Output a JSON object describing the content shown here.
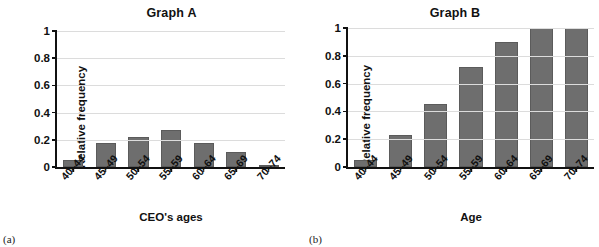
{
  "figure": {
    "panels": [
      {
        "caption": "(a)",
        "title": "Graph A",
        "ylabel": "Relative frequency",
        "xlabel": "CEO's ages",
        "bar_color": "#6e6e6e",
        "chart_data": {
          "type": "bar",
          "title": "Graph A",
          "xlabel": "CEO's ages",
          "ylabel": "Relative frequency",
          "categories": [
            "40–44",
            "45–49",
            "50–54",
            "55–59",
            "60–64",
            "65–69",
            "70–74"
          ],
          "values": [
            0.05,
            0.18,
            0.22,
            0.27,
            0.18,
            0.11,
            0.01
          ],
          "ylim": [
            0,
            1
          ],
          "yticks": [
            "0",
            "0.2",
            "0.4",
            "0.6",
            "0.8",
            "1"
          ],
          "ytick_values": [
            0,
            0.2,
            0.4,
            0.6,
            0.8,
            1
          ],
          "grid": true,
          "legend": "none"
        }
      },
      {
        "caption": "(b)",
        "title": "Graph B",
        "ylabel": "Relative frequency",
        "xlabel": "Age",
        "bar_color": "#6e6e6e",
        "chart_data": {
          "type": "bar",
          "title": "Graph B",
          "xlabel": "Age",
          "ylabel": "Relative frequency",
          "categories": [
            "40–44",
            "45–49",
            "50–54",
            "55–59",
            "60–64",
            "65–69",
            "70–74"
          ],
          "values": [
            0.05,
            0.23,
            0.45,
            0.72,
            0.9,
            1.0,
            1.0
          ],
          "ylim": [
            0,
            1
          ],
          "yticks": [
            "0",
            "0.2",
            "0.4",
            "0.6",
            "0.8",
            "1"
          ],
          "ytick_values": [
            0,
            0.2,
            0.4,
            0.6,
            0.8,
            1
          ],
          "grid": true,
          "legend": "none"
        }
      }
    ]
  },
  "chart_data": [
    {
      "type": "bar",
      "title": "Graph A",
      "xlabel": "CEO's ages",
      "ylabel": "Relative frequency",
      "categories": [
        "40–44",
        "45–49",
        "50–54",
        "55–59",
        "60–64",
        "65–69",
        "70–74"
      ],
      "values": [
        0.05,
        0.18,
        0.22,
        0.27,
        0.18,
        0.11,
        0.01
      ],
      "ylim": [
        0,
        1
      ],
      "yticks": [
        "0",
        "0.2",
        "0.4",
        "0.6",
        "0.8",
        "1"
      ],
      "grid": true,
      "legend": "none"
    },
    {
      "type": "bar",
      "title": "Graph B",
      "xlabel": "Age",
      "ylabel": "Relative frequency",
      "categories": [
        "40–44",
        "45–49",
        "50–54",
        "55–59",
        "60–64",
        "65–69",
        "70–74"
      ],
      "values": [
        0.05,
        0.23,
        0.45,
        0.72,
        0.9,
        1.0,
        1.0
      ],
      "ylim": [
        0,
        1
      ],
      "yticks": [
        "0",
        "0.2",
        "0.4",
        "0.6",
        "0.8",
        "1"
      ],
      "grid": true,
      "legend": "none"
    }
  ]
}
